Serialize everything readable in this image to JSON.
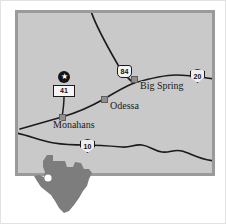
{
  "map": {
    "title": "West Texas regional highway map",
    "background_color": "#c9c9c9",
    "frame_color": "#9a9a9a",
    "road_color": "#1b1b1b",
    "city_marker_color": "#8f8f8f",
    "state_fill_color": "#7d7d7d"
  },
  "cities": [
    {
      "name": "Big Spring",
      "marker": "city-square"
    },
    {
      "name": "Odessa",
      "marker": "city-square"
    },
    {
      "name": "Monahans",
      "marker": "city-square"
    }
  ],
  "highways": [
    {
      "label": "84",
      "type": "us-route",
      "icon": "us-shield-icon"
    },
    {
      "label": "20",
      "type": "interstate",
      "icon": "interstate-shield-icon"
    },
    {
      "label": "10",
      "type": "interstate",
      "icon": "interstate-shield-icon"
    },
    {
      "label": "41",
      "type": "state-route",
      "icon": "state-route-marker-icon"
    }
  ],
  "site_marker": {
    "glyph": "★",
    "icon": "star-site-marker-icon"
  },
  "inset": {
    "state": "Texas",
    "location_dot": "location-dot-icon"
  }
}
